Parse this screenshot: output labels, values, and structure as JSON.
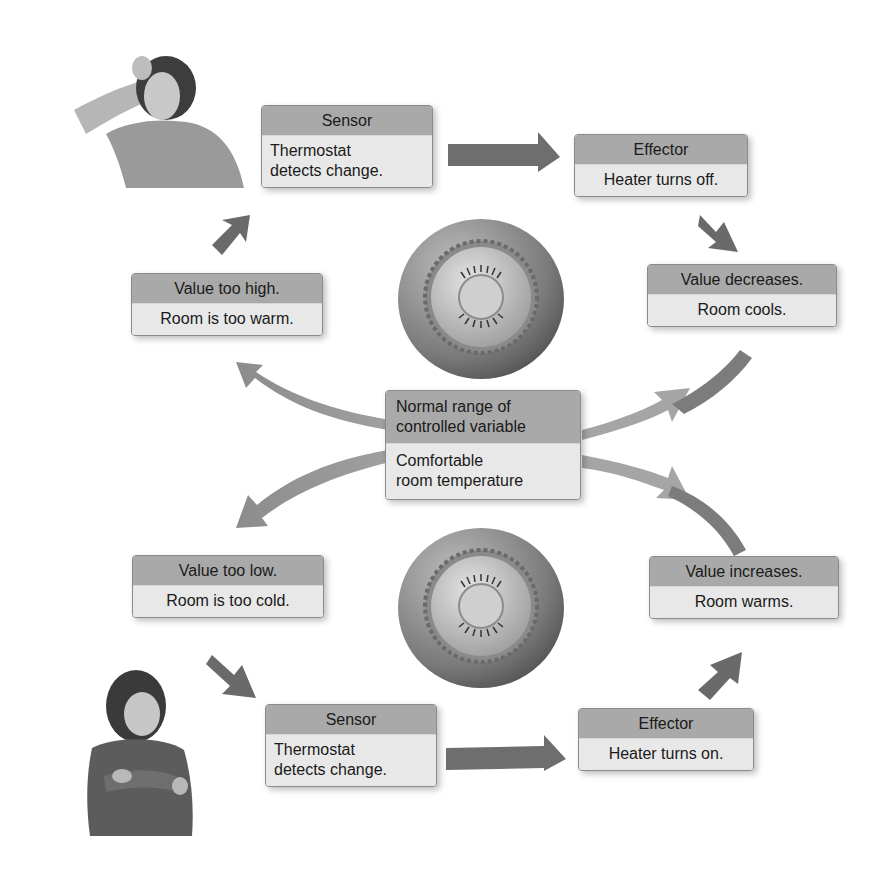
{
  "diagram": {
    "center": {
      "header": "Normal range of controlled variable",
      "header_line1": "Normal range of",
      "header_line2": "controlled variable",
      "body_line1": "Comfortable",
      "body_line2": "room temperature"
    },
    "upper_loop": {
      "stimulus": {
        "header": "Value too high.",
        "body": "Room is too warm."
      },
      "sensor": {
        "header": "Sensor",
        "body_line1": "Thermostat",
        "body_line2": "detects change."
      },
      "effector": {
        "header": "Effector",
        "body": "Heater turns off."
      },
      "response": {
        "header": "Value decreases.",
        "body": "Room cools."
      }
    },
    "lower_loop": {
      "stimulus": {
        "header": "Value too low.",
        "body": "Room is too cold."
      },
      "sensor": {
        "header": "Sensor",
        "body_line1": "Thermostat",
        "body_line2": "detects change."
      },
      "effector": {
        "header": "Effector",
        "body": "Heater turns on."
      },
      "response": {
        "header": "Value increases.",
        "body": "Room warms."
      }
    },
    "illustrations": {
      "top_person": "woman-too-warm",
      "bottom_person": "woman-too-cold",
      "top_dial": "thermostat-dial",
      "bottom_dial": "thermostat-dial"
    },
    "colors": {
      "box_header": "#a9a9a9",
      "box_body": "#e8e8e8",
      "arrow_dark": "#6e6e6e",
      "arrow_light": "#b4b4b4"
    }
  }
}
